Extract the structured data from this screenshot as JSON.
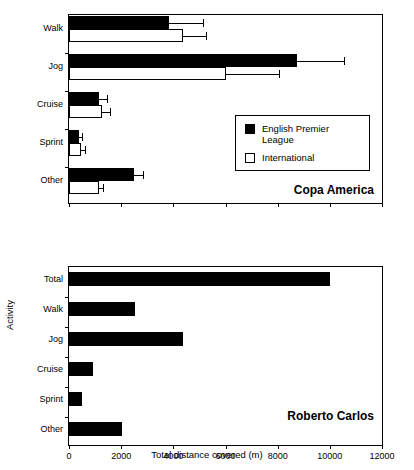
{
  "chart_data": [
    {
      "type": "bar",
      "orientation": "horizontal",
      "title": "Copa America",
      "xlabel": "",
      "ylabel": "",
      "xlim": [
        0,
        12000
      ],
      "xticks": [
        0,
        2000,
        4000,
        6000,
        8000,
        10000,
        12000
      ],
      "grid": false,
      "legend_position": "center-right",
      "categories": [
        "Walk",
        "Jog",
        "Cruise",
        "Sprint",
        "Other"
      ],
      "series": [
        {
          "name": "English Premier League",
          "color": "#000000",
          "fill": "solid",
          "values": [
            3820,
            8750,
            1150,
            380,
            2480
          ],
          "errors": [
            1300,
            1800,
            320,
            120,
            370
          ]
        },
        {
          "name": "International",
          "color": "#ffffff",
          "fill": "open",
          "values": [
            4360,
            6030,
            1260,
            450,
            1150
          ],
          "errors": [
            900,
            2030,
            330,
            170,
            160
          ]
        }
      ]
    },
    {
      "type": "bar",
      "orientation": "horizontal",
      "title": "Roberto Carlos",
      "xlabel": "Total distance covered (m)",
      "ylabel": "Activity",
      "xlim": [
        0,
        12000
      ],
      "xticks": [
        0,
        2000,
        4000,
        6000,
        8000,
        10000,
        12000
      ],
      "grid": false,
      "categories": [
        "Total",
        "Walk",
        "Jog",
        "Cruise",
        "Sprint",
        "Other"
      ],
      "series": [
        {
          "name": "Roberto Carlos",
          "color": "#000000",
          "fill": "solid",
          "values": [
            10010,
            2520,
            4360,
            920,
            500,
            2020
          ]
        }
      ]
    }
  ],
  "axes": {
    "x_title": "Total distance covered (m)",
    "y_title": "Activity",
    "tick_labels": [
      "0",
      "2000",
      "4000",
      "6000",
      "8000",
      "10000",
      "12000"
    ]
  },
  "top_panel": {
    "caption": "Copa America",
    "category_labels": [
      "Walk",
      "Jog",
      "Cruise",
      "Sprint",
      "Other"
    ],
    "legend": {
      "items": [
        {
          "label": "English Premier League",
          "swatch": "filled-square"
        },
        {
          "label": "International",
          "swatch": "open-square"
        }
      ]
    }
  },
  "bottom_panel": {
    "caption": "Roberto Carlos",
    "category_labels": [
      "Total",
      "Walk",
      "Jog",
      "Cruise",
      "Sprint",
      "Other"
    ]
  }
}
